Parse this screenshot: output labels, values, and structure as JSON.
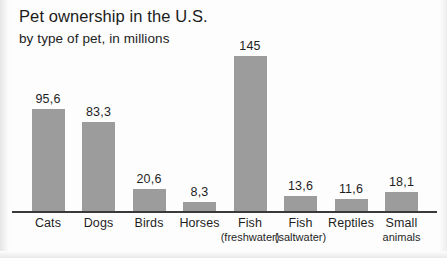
{
  "chart_data": {
    "type": "bar",
    "title": "Pet ownership in the U.S.",
    "subtitle": "by type of pet, in millions",
    "xlabel": "",
    "ylabel": "",
    "ylim": [
      0,
      145
    ],
    "grid": false,
    "legend": null,
    "categories": [
      "Cats",
      "Dogs",
      "Birds",
      "Horses",
      "Fish (freshwater)",
      "Fish (saltwater)",
      "Reptiles",
      "Small animals"
    ],
    "category_lines": [
      [
        "Cats",
        ""
      ],
      [
        "Dogs",
        ""
      ],
      [
        "Birds",
        ""
      ],
      [
        "Horses",
        ""
      ],
      [
        "Fish",
        "(freshwater)"
      ],
      [
        "Fish",
        "(saltwater)"
      ],
      [
        "Reptiles",
        ""
      ],
      [
        "Small",
        "animals"
      ]
    ],
    "values": [
      95.6,
      83.3,
      20.6,
      8.3,
      145,
      13.6,
      11.6,
      18.1
    ],
    "value_labels": [
      "95,6",
      "83,3",
      "20,6",
      "8,3",
      "145",
      "13,6",
      "11,6",
      "18,1"
    ],
    "bar_color": "#9c9c9c",
    "axis_color": "#3a3a3a",
    "text_color": "#1f1f1f",
    "background": "#fdfdfd"
  }
}
